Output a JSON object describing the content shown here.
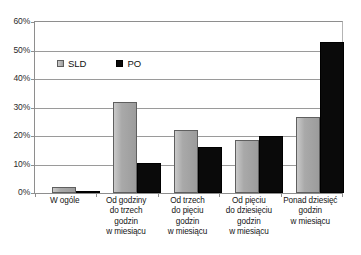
{
  "chart_data": {
    "type": "bar",
    "title": "",
    "subtitle": "",
    "xlabel": "",
    "ylabel": "",
    "ylim": [
      0,
      60
    ],
    "ytick_labels": [
      "60%",
      "50%",
      "40%",
      "30%",
      "20%",
      "10%",
      "0%"
    ],
    "ytick_values": [
      60,
      50,
      40,
      30,
      20,
      10,
      0
    ],
    "grid": true,
    "legend_position": "inside-top-left",
    "categories": [
      "W ogóle",
      "Od godziny do trzech godzin w miesiącu",
      "Od trzech do pięciu godzin w miesiącu",
      "Od pięciu do dziesięciu godzin w miesiącu",
      "Ponad dziesięć godzin w miesiącu"
    ],
    "category_lines": [
      [
        "W ogóle"
      ],
      [
        "Od godziny",
        "do trzech",
        "godzin",
        "w miesiącu"
      ],
      [
        "Od trzech",
        "do pięciu",
        "godzin",
        "w miesiącu"
      ],
      [
        "Od pięciu",
        "do dziesięciu",
        "godzin",
        "w miesiącu"
      ],
      [
        "Ponad dziesięć",
        "godzin",
        "w miesiącu"
      ]
    ],
    "series": [
      {
        "name": "SLD",
        "color": "#a9a9a9",
        "values": [
          2.0,
          31.8,
          22.0,
          18.5,
          26.5
        ]
      },
      {
        "name": "PO",
        "color": "#0a0a0a",
        "values": [
          0.4,
          10.5,
          16.0,
          20.0,
          53.0
        ]
      }
    ]
  },
  "legend": {
    "items": [
      {
        "label": "SLD",
        "color": "#a9a9a9"
      },
      {
        "label": "PO",
        "color": "#0a0a0a"
      }
    ]
  }
}
